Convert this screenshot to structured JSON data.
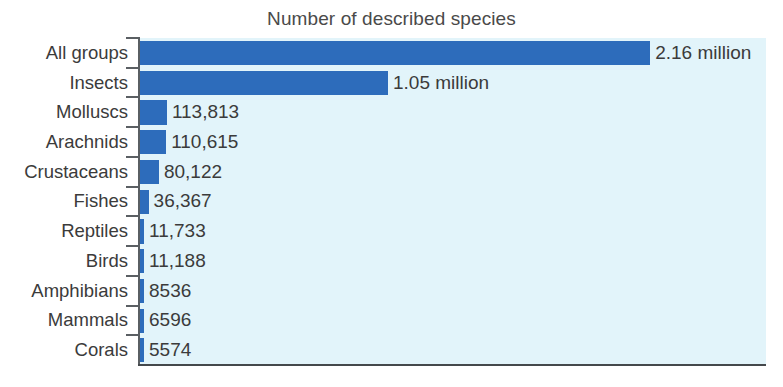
{
  "chart_data": {
    "type": "bar",
    "orientation": "horizontal",
    "title": "Number of described species",
    "xlabel": "",
    "ylabel": "",
    "xlim": [
      0,
      2160000
    ],
    "grid": false,
    "legend": false,
    "categories": [
      "All groups",
      "Insects",
      "Molluscs",
      "Arachnids",
      "Crustaceans",
      "Fishes",
      "Reptiles",
      "Birds",
      "Amphibians",
      "Mammals",
      "Corals"
    ],
    "values": [
      2160000,
      1050000,
      113813,
      110615,
      80122,
      36367,
      11733,
      11188,
      8536,
      6596,
      5574
    ],
    "data_labels": [
      "2.16 million",
      "1.05 million",
      "113,813",
      "110,615",
      "80,122",
      "36,367",
      "11,733",
      "11,188",
      "8536",
      "6596",
      "5574"
    ]
  },
  "colors": {
    "bar": "#2d6cbb",
    "plot_background": "#e2f4fa",
    "axis": "#5a5f63",
    "text": "#3b3b3b",
    "title_text": "#4a4a4a",
    "page_background": "#ffffff"
  }
}
